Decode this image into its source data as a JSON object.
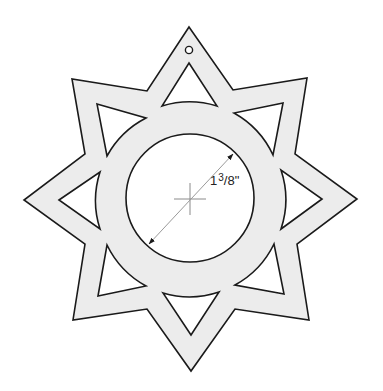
{
  "diagram": {
    "type": "ornament-template",
    "shape": "eight-pointed star with central ring",
    "colors": {
      "background": "#ffffff",
      "fill": "#ececec",
      "outline": "#1a1a1a",
      "dimension_line": "#9a9a9a",
      "crosshair": "#8a8a8a"
    },
    "dimension": {
      "whole": "1",
      "numerator": "3",
      "denominator": "/8\"",
      "full_label": "1 3/8\""
    },
    "features": {
      "hanging_hole": "hole-icon",
      "center_mark": "crosshair-icon",
      "points": 8,
      "triangle_cutouts": 8
    }
  }
}
